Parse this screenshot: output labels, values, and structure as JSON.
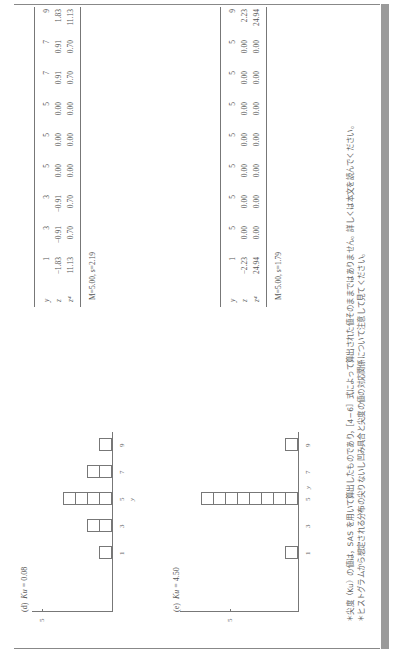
{
  "panels": [
    {
      "id": "d",
      "label": "(d)",
      "stat_name": "Ku",
      "stat_value": "= 0.08",
      "histogram": {
        "x_ticks": [
          "1",
          "3",
          "5",
          "7",
          "9"
        ],
        "x_label": "y",
        "y_tick": "5",
        "counts": [
          1,
          2,
          4,
          2,
          1
        ]
      },
      "table": {
        "rows": [
          {
            "label": "y",
            "values": [
              "1",
              "3",
              "3",
              "5",
              "5",
              "5",
              "7",
              "7",
              "9"
            ]
          },
          {
            "label": "z",
            "values": [
              "−1.83",
              "−0.91",
              "−0.91",
              "0.00",
              "0.00",
              "0.00",
              "0.91",
              "0.91",
              "1.83"
            ]
          },
          {
            "label": "z⁴",
            "values": [
              "11.13",
              "0.70",
              "0.70",
              "0.00",
              "0.00",
              "0.00",
              "0.70",
              "0.70",
              "11.13"
            ]
          }
        ],
        "stats": "M=5.00,  s=2.19"
      }
    },
    {
      "id": "e",
      "label": "(e)",
      "stat_name": "Ku",
      "stat_value": "= 4.50",
      "histogram": {
        "x_ticks": [
          "1",
          "3",
          "5",
          "7",
          "9"
        ],
        "x_label": "y",
        "y_tick": "5",
        "counts": [
          1,
          0,
          8,
          0,
          1
        ]
      },
      "table": {
        "rows": [
          {
            "label": "y",
            "values": [
              "1",
              "5",
              "5",
              "5",
              "5",
              "5",
              "5",
              "5",
              "9"
            ]
          },
          {
            "label": "z",
            "values": [
              "−2.23",
              "0.00",
              "0.00",
              "0.00",
              "0.00",
              "0.00",
              "0.00",
              "0.00",
              "2.23"
            ]
          },
          {
            "label": "z⁴",
            "values": [
              "24.94",
              "0.00",
              "0.00",
              "0.00",
              "0.00",
              "0.00",
              "0.00",
              "0.00",
              "24.94"
            ]
          }
        ],
        "stats": "M=5.00,  s=1.79"
      }
    }
  ],
  "notes": [
    "＊尖度（Ku）の値は，SAS を用いて算出したものであり，［4−6］式によって算出された値そのままではありません。詳しくは本文を読んでください。",
    "＊ヒストグラムから想定される分布の尖りないし凹み具合と尖度の値の対応関係について注意して見てください。"
  ]
}
